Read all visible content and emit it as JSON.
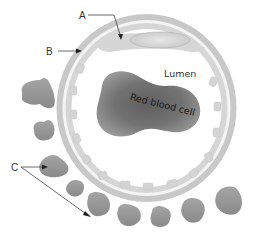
{
  "figure": {
    "labels": {
      "a": "A",
      "b": "B",
      "c": "C",
      "lumen": "Lumen",
      "red_blood_cell": "Red blood cell"
    },
    "colors": {
      "background": "#ffffff",
      "wall": "#c4c4c4",
      "inner_wall": "#e0e0e0",
      "lumen": "#ffffff",
      "rbc": "#8a8a8a",
      "rbc_center": "#6e6e6e",
      "pericyte": "#9a9a9a",
      "nucleus": "#d2d2d2",
      "leader_line": "#333333"
    }
  }
}
